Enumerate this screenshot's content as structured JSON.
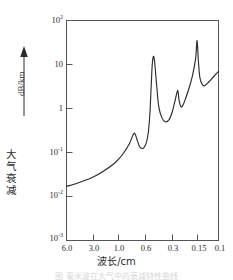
{
  "figure": {
    "arrow_icon": "up-arrow-icon",
    "y_axis": {
      "label_cn": "大气衰减",
      "label_cn_chars": [
        "大",
        "气",
        "衰",
        "减"
      ],
      "unit": "dB/km",
      "tick_labels": [
        "10",
        "10",
        "1",
        "10",
        "10",
        "10"
      ],
      "tick_exponents": [
        "2",
        "",
        "",
        "-1",
        "-2",
        "-3"
      ]
    },
    "x_axis": {
      "label": "波长/cm",
      "tick_labels": [
        "6.0",
        "3.0",
        "1.0",
        "0.6",
        "0.3",
        "0.15",
        "0.1"
      ]
    },
    "caption": "图  毫米波在大气中的衰减特性曲线"
  },
  "chart_data": {
    "type": "line",
    "title": "",
    "xlabel": "波长/cm",
    "ylabel": "大气衰减 dB/km",
    "xscale": "log-reversed",
    "yscale": "log",
    "grid": false,
    "legend": null,
    "xtick_labels": [
      "6.0",
      "3.0",
      "1.0",
      "0.6",
      "0.3",
      "0.15",
      "0.1"
    ],
    "ytick_labels": [
      "10^2",
      "10",
      "1",
      "10^-1",
      "10^-2",
      "10^-3"
    ],
    "ylim": [
      0.001,
      100
    ],
    "xlim": [
      6.0,
      0.1
    ],
    "series": [
      {
        "name": "atmospheric attenuation",
        "color": "#2b2b2b",
        "points": [
          {
            "x": 6.0,
            "y": 0.017
          },
          {
            "x": 4.5,
            "y": 0.02
          },
          {
            "x": 3.0,
            "y": 0.027
          },
          {
            "x": 2.2,
            "y": 0.038
          },
          {
            "x": 1.6,
            "y": 0.06
          },
          {
            "x": 1.3,
            "y": 0.095
          },
          {
            "x": 1.1,
            "y": 0.16
          },
          {
            "x": 1.0,
            "y": 0.25
          },
          {
            "x": 0.95,
            "y": 0.27
          },
          {
            "x": 0.9,
            "y": 0.2
          },
          {
            "x": 0.85,
            "y": 0.145
          },
          {
            "x": 0.8,
            "y": 0.125
          },
          {
            "x": 0.75,
            "y": 0.128
          },
          {
            "x": 0.7,
            "y": 0.165
          },
          {
            "x": 0.66,
            "y": 0.3
          },
          {
            "x": 0.63,
            "y": 1.0
          },
          {
            "x": 0.6,
            "y": 8.0
          },
          {
            "x": 0.58,
            "y": 15.0
          },
          {
            "x": 0.56,
            "y": 12.0
          },
          {
            "x": 0.53,
            "y": 3.5
          },
          {
            "x": 0.5,
            "y": 1.1
          },
          {
            "x": 0.46,
            "y": 0.62
          },
          {
            "x": 0.42,
            "y": 0.5
          },
          {
            "x": 0.38,
            "y": 0.55
          },
          {
            "x": 0.35,
            "y": 0.8
          },
          {
            "x": 0.32,
            "y": 1.6
          },
          {
            "x": 0.3,
            "y": 2.6
          },
          {
            "x": 0.29,
            "y": 1.6
          },
          {
            "x": 0.275,
            "y": 1.1
          },
          {
            "x": 0.26,
            "y": 1.2
          },
          {
            "x": 0.24,
            "y": 1.8
          },
          {
            "x": 0.22,
            "y": 3.0
          },
          {
            "x": 0.2,
            "y": 6.0
          },
          {
            "x": 0.185,
            "y": 14.0
          },
          {
            "x": 0.178,
            "y": 35.0
          },
          {
            "x": 0.172,
            "y": 12.0
          },
          {
            "x": 0.165,
            "y": 5.0
          },
          {
            "x": 0.155,
            "y": 3.5
          },
          {
            "x": 0.145,
            "y": 3.3
          },
          {
            "x": 0.13,
            "y": 4.0
          },
          {
            "x": 0.115,
            "y": 5.2
          },
          {
            "x": 0.1,
            "y": 7.0
          }
        ]
      }
    ]
  }
}
